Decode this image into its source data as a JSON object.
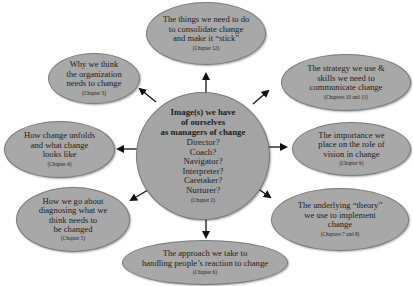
{
  "diagram": {
    "center": {
      "title": "Image(s) we have\nof ourselves\nas managers of change",
      "roles": [
        "Director?",
        "Coach?",
        "Navigator?",
        "Interpreter?",
        "Caretaker?",
        "Nurturer?"
      ],
      "chapter": "(Chapter 2)"
    },
    "nodes": [
      {
        "id": "consolidate",
        "text": "The things we need to do\nto consolidate change\nand make it “stick”",
        "chapter": "(Chapter 12)"
      },
      {
        "id": "why-change",
        "text": "Why we think\nthe organization\nneeds to change",
        "chapter": "(Chapter 3)"
      },
      {
        "id": "strategy",
        "text": "The strategy we use &\nskills we need to\ncommunicate change",
        "chapter": "(Chapters 10 and 11)"
      },
      {
        "id": "unfolds",
        "text": "How change unfolds\nand what change\nlooks like",
        "chapter": "(Chapter 4)"
      },
      {
        "id": "vision",
        "text": "The importance we\nplace on the role of\nvision in change",
        "chapter": "(Chapter 9)"
      },
      {
        "id": "diagnosing",
        "text": "How we go about\ndiagnosing what we\nthink needs to\nbe changed",
        "chapter": "(Chapter 5)"
      },
      {
        "id": "theory",
        "text": "The underlying “theory”\nwe use to implement\nchange",
        "chapter": "(Chapters 7 and 8)"
      },
      {
        "id": "reaction",
        "text": "The approach we take to\nhandling people’s reaction to change",
        "chapter": "(Chapter 6)"
      }
    ],
    "colors": {
      "node_fill": "#a8a8a8",
      "node_border": "#7a7a7a",
      "arrow": "#111111",
      "text": "#1e1e1e",
      "background": "#ffffff"
    }
  }
}
